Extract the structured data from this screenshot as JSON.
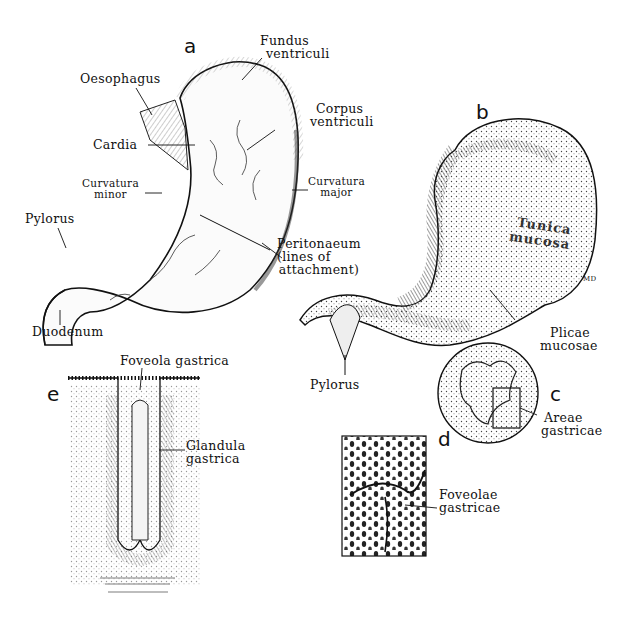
{
  "figure": {
    "panels": [
      {
        "id": "a",
        "label": "a"
      },
      {
        "id": "b",
        "label": "b"
      },
      {
        "id": "c",
        "label": "c"
      },
      {
        "id": "d",
        "label": "d"
      },
      {
        "id": "e",
        "label": "e"
      }
    ],
    "panel_a_labels": {
      "fundus": [
        "Fundus",
        "ventriculi"
      ],
      "oesophagus": "Oesophagus",
      "corpus": [
        "Corpus",
        "ventriculi"
      ],
      "cardia": "Cardia",
      "curvatura_minor": [
        "Curvatura",
        "minor"
      ],
      "curvatura_major": [
        "Curvatura",
        "major"
      ],
      "pylorus": "Pylorus",
      "peritonaeum": [
        "Peritonaeum",
        "(lines of",
        "attachment)"
      ],
      "duodenum": "Duodenum"
    },
    "panel_b_labels": {
      "tunica_mucosa": [
        "Tunica",
        "mucosa"
      ],
      "plicae_mucosae": [
        "Plicae",
        "mucosae"
      ],
      "pylorus": "Pylorus",
      "signature": "MD"
    },
    "panel_c_labels": {
      "areae_gastricae": [
        "Areae",
        "gastricae"
      ]
    },
    "panel_d_labels": {
      "foveolae_gastricae": [
        "Foveolae",
        "gastricae"
      ]
    },
    "panel_e_labels": {
      "foveola_gastrica": "Foveola gastrica",
      "glandula_gastrica": [
        "Glandula",
        "gastrica"
      ]
    }
  }
}
